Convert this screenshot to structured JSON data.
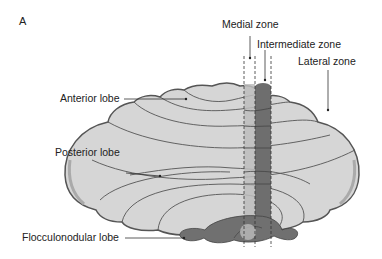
{
  "panel_label": "A",
  "labels": {
    "medial_zone": "Medial zone",
    "intermediate_zone": "Intermediate zone",
    "lateral_zone": "Lateral zone",
    "anterior_lobe": "Anterior lobe",
    "posterior_lobe": "Posterior lobe",
    "flocculonodular_lobe": "Flocculonodular lobe"
  },
  "colors": {
    "body_fill": "#d6d6d6",
    "outline": "#555555",
    "medial_zone_fill": "#bdbdbd",
    "intermediate_zone_fill": "#6e6e6e",
    "flocculus_fill": "#707070"
  }
}
